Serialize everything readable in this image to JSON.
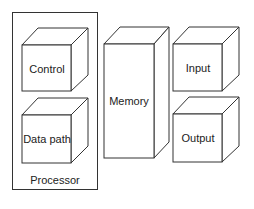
{
  "diagram": {
    "type": "block-diagram",
    "stroke_color": "#333333",
    "background": "#ffffff",
    "container": {
      "label": "Processor",
      "contains": [
        "Control",
        "Data path"
      ]
    },
    "components": [
      {
        "id": "control",
        "label": "Control",
        "shape": "cube"
      },
      {
        "id": "datapath",
        "label": "Data path",
        "shape": "cube"
      },
      {
        "id": "memory",
        "label": "Memory",
        "shape": "tall-cube"
      },
      {
        "id": "input",
        "label": "Input",
        "shape": "cube"
      },
      {
        "id": "output",
        "label": "Output",
        "shape": "cube"
      }
    ]
  }
}
